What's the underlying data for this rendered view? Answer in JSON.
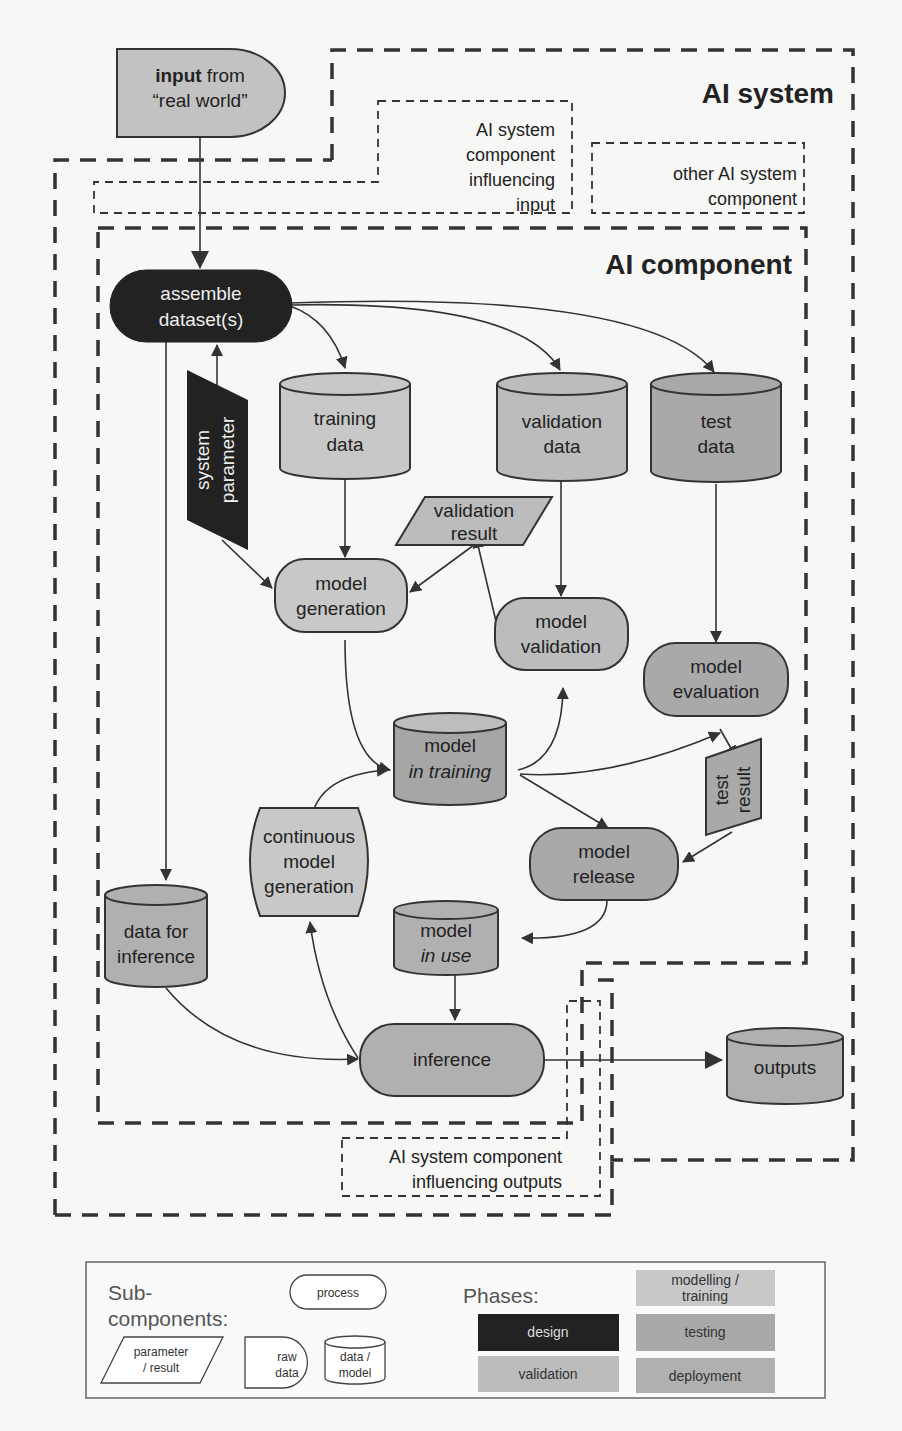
{
  "colors": {
    "design": "#222222",
    "modelling_training": "#c8c8c8",
    "testing": "#a9a9a9",
    "validation": "#bcbcbc",
    "deployment": "#b0b0b0",
    "raw_input": "#c2c2c2"
  },
  "regions": {
    "ai_system": "AI system",
    "ai_component": "AI component",
    "influencing_input": [
      "AI system",
      "component",
      "influencing",
      "input"
    ],
    "other_component": [
      "other AI system",
      "component"
    ],
    "influencing_outputs": [
      "AI system component",
      "influencing outputs"
    ]
  },
  "nodes": {
    "input_real_world": {
      "bold": "input",
      "rest": " from",
      "line2": "“real world”",
      "type": "raw data"
    },
    "assemble_datasets": {
      "lines": [
        "assemble",
        "dataset(s)"
      ],
      "type": "process",
      "phase": "design"
    },
    "system_parameter": {
      "lines": [
        "system",
        "parameter"
      ],
      "type": "parameter",
      "phase": "design"
    },
    "training_data": {
      "lines": [
        "training",
        "data"
      ],
      "type": "data",
      "phase": "modelling/training"
    },
    "validation_data": {
      "lines": [
        "validation",
        "data"
      ],
      "type": "data",
      "phase": "validation"
    },
    "test_data": {
      "lines": [
        "test",
        "data"
      ],
      "type": "data",
      "phase": "testing"
    },
    "validation_result": {
      "lines": [
        "validation",
        "result"
      ],
      "type": "result",
      "phase": "validation"
    },
    "model_generation": {
      "lines": [
        "model",
        "generation"
      ],
      "type": "process",
      "phase": "modelling/training"
    },
    "model_validation": {
      "lines": [
        "model",
        "validation"
      ],
      "type": "process",
      "phase": "validation"
    },
    "model_evaluation": {
      "lines": [
        "model",
        "evaluation"
      ],
      "type": "process",
      "phase": "testing"
    },
    "model_in_training": {
      "lines": [
        "model",
        "in training"
      ],
      "type": "model",
      "phase": "modelling/training"
    },
    "test_result": {
      "lines": [
        "test",
        "result"
      ],
      "type": "result",
      "phase": "testing"
    },
    "continuous_model_generation": {
      "lines": [
        "continuous",
        "model",
        "generation"
      ],
      "type": "process",
      "phase": "deployment"
    },
    "model_release": {
      "lines": [
        "model",
        "release"
      ],
      "type": "process",
      "phase": "testing"
    },
    "data_for_inference": {
      "lines": [
        "data for",
        "inference"
      ],
      "type": "data",
      "phase": "deployment"
    },
    "model_in_use": {
      "lines": [
        "model",
        "in use"
      ],
      "type": "model",
      "phase": "deployment"
    },
    "inference": {
      "lines": [
        "inference"
      ],
      "type": "process",
      "phase": "deployment"
    },
    "outputs": {
      "lines": [
        "outputs"
      ],
      "type": "data",
      "phase": "deployment"
    }
  },
  "edges": [
    [
      "input_real_world",
      "assemble_datasets"
    ],
    [
      "system_parameter",
      "assemble_datasets"
    ],
    [
      "system_parameter",
      "model_generation"
    ],
    [
      "assemble_datasets",
      "training_data"
    ],
    [
      "assemble_datasets",
      "validation_data"
    ],
    [
      "assemble_datasets",
      "test_data"
    ],
    [
      "assemble_datasets",
      "data_for_inference"
    ],
    [
      "training_data",
      "model_generation"
    ],
    [
      "validation_result",
      "model_generation"
    ],
    [
      "model_validation",
      "validation_result"
    ],
    [
      "validation_data",
      "model_validation"
    ],
    [
      "test_data",
      "model_evaluation"
    ],
    [
      "model_generation",
      "model_in_training"
    ],
    [
      "model_in_training",
      "model_validation"
    ],
    [
      "model_in_training",
      "model_evaluation"
    ],
    [
      "model_in_training",
      "model_release"
    ],
    [
      "model_evaluation",
      "test_result"
    ],
    [
      "test_result",
      "model_release"
    ],
    [
      "continuous_model_generation",
      "model_in_training"
    ],
    [
      "model_release",
      "model_in_use"
    ],
    [
      "model_in_use",
      "inference"
    ],
    [
      "data_for_inference",
      "inference"
    ],
    [
      "inference",
      "continuous_model_generation"
    ],
    [
      "inference",
      "outputs"
    ]
  ],
  "legend": {
    "subcomponents_title": [
      "Sub-",
      "components:"
    ],
    "process": "process",
    "parameter_result": [
      "parameter",
      "/  result"
    ],
    "raw_data": [
      "raw",
      "data"
    ],
    "data_model": [
      "data /",
      "model"
    ],
    "phases_title": "Phases:",
    "phases": {
      "modelling_training": [
        "modelling /",
        "training"
      ],
      "design": "design",
      "testing": "testing",
      "validation": "validation",
      "deployment": "deployment"
    }
  }
}
